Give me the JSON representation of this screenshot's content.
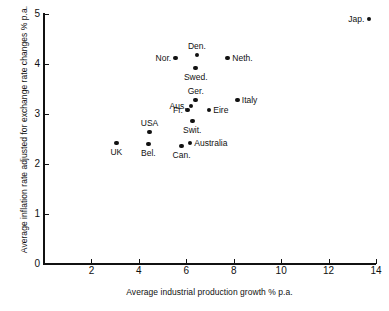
{
  "chart_data": {
    "type": "scatter",
    "title": "",
    "xlabel": "Average industrial production growth % p.a.",
    "ylabel": "Average inflation rate adjusted for exchange rate changes % p.a.",
    "xlim": [
      0,
      14
    ],
    "ylim": [
      0,
      5
    ],
    "xticks": [
      0,
      2,
      4,
      6,
      8,
      10,
      12,
      14
    ],
    "xtick_labels": [
      "0",
      "2",
      "4",
      "6",
      "8",
      "10",
      "12",
      "14"
    ],
    "yticks": [
      0,
      1,
      2,
      3,
      4,
      5
    ],
    "ytick_labels": [
      "0",
      "1",
      "2",
      "3",
      "4",
      "5"
    ],
    "grid": false,
    "legend": "none",
    "marker": "filled-circle",
    "marker_color": "#111111",
    "points": [
      {
        "label": "Jap.",
        "x": 13.7,
        "y": 4.9,
        "label_pos": "left"
      },
      {
        "label": "Den.",
        "x": 6.45,
        "y": 4.18,
        "label_pos": "above"
      },
      {
        "label": "Nor.",
        "x": 5.55,
        "y": 4.12,
        "label_pos": "left"
      },
      {
        "label": "Neth.",
        "x": 7.75,
        "y": 4.12,
        "label_pos": "right"
      },
      {
        "label": "Swed.",
        "x": 6.4,
        "y": 3.92,
        "label_pos": "below"
      },
      {
        "label": "Ger.",
        "x": 6.4,
        "y": 3.28,
        "label_pos": "above"
      },
      {
        "label": "Italy",
        "x": 8.15,
        "y": 3.28,
        "label_pos": "right"
      },
      {
        "label": "Aus.",
        "x": 6.2,
        "y": 3.16,
        "label_pos": "left"
      },
      {
        "label": "Fr.",
        "x": 6.05,
        "y": 3.08,
        "label_pos": "left"
      },
      {
        "label": "Eire",
        "x": 6.95,
        "y": 3.08,
        "label_pos": "right"
      },
      {
        "label": "Swit.",
        "x": 6.25,
        "y": 2.86,
        "label_pos": "below"
      },
      {
        "label": "USA",
        "x": 4.45,
        "y": 2.64,
        "label_pos": "above"
      },
      {
        "label": "Australia",
        "x": 6.15,
        "y": 2.42,
        "label_pos": "right"
      },
      {
        "label": "UK",
        "x": 3.05,
        "y": 2.42,
        "label_pos": "below"
      },
      {
        "label": "Bel.",
        "x": 4.4,
        "y": 2.4,
        "label_pos": "below"
      },
      {
        "label": "Can.",
        "x": 5.8,
        "y": 2.36,
        "label_pos": "below"
      }
    ]
  }
}
